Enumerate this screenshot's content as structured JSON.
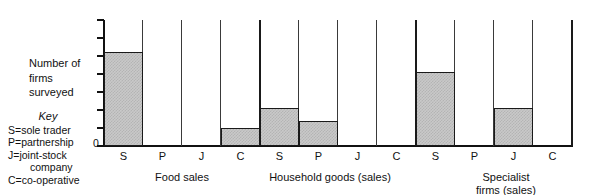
{
  "axis_title": "Number of\nfirms\nsurveyed",
  "key": {
    "title": "Key",
    "entries": [
      "S=sole trader",
      "P=partnership",
      "J=joint-stock",
      "company",
      "C=co-operative"
    ]
  },
  "zero_label": "0",
  "colors": {
    "bar_fill": "#c9c9c9",
    "bar_pattern": "#b4b4b4",
    "line": "#1a1a1a",
    "text": "#111111",
    "background": "#ffffff"
  },
  "chart_data": {
    "type": "bar",
    "title": "",
    "subtitle": "",
    "xlabel": "",
    "ylabel": "Number of firms surveyed",
    "ylim": [
      0,
      7
    ],
    "yticks": [
      0,
      1,
      2,
      3,
      4,
      5,
      6,
      7
    ],
    "ytick_labels": [
      "0",
      "",
      "",
      "",
      "",
      "",
      "",
      ""
    ],
    "grid": false,
    "legend_position": "left",
    "legend_entries": [
      "S=sole trader",
      "P=partnership",
      "J=joint-stock company",
      "C=co-operative"
    ],
    "groups": [
      "Food sales",
      "Household goods (sales)",
      "Specialist firms (sales)"
    ],
    "categories": [
      "S",
      "P",
      "J",
      "C",
      "S",
      "P",
      "J",
      "C",
      "S",
      "P",
      "J",
      "C"
    ],
    "values": [
      5.2,
      0,
      0,
      1,
      2.1,
      1.4,
      0,
      0,
      4.1,
      0,
      2.1,
      0
    ],
    "bars": [
      {
        "group": "Food sales",
        "category": "S",
        "value": 5.2
      },
      {
        "group": "Food sales",
        "category": "P",
        "value": 0
      },
      {
        "group": "Food sales",
        "category": "J",
        "value": 0
      },
      {
        "group": "Food sales",
        "category": "C",
        "value": 1.0
      },
      {
        "group": "Household goods (sales)",
        "category": "S",
        "value": 2.1
      },
      {
        "group": "Household goods (sales)",
        "category": "P",
        "value": 1.4
      },
      {
        "group": "Household goods (sales)",
        "category": "J",
        "value": 0
      },
      {
        "group": "Household goods (sales)",
        "category": "C",
        "value": 0
      },
      {
        "group": "Specialist firms (sales)",
        "category": "S",
        "value": 4.1
      },
      {
        "group": "Specialist firms (sales)",
        "category": "P",
        "value": 0
      },
      {
        "group": "Specialist firms (sales)",
        "category": "J",
        "value": 2.1
      },
      {
        "group": "Specialist firms (sales)",
        "category": "C",
        "value": 0
      }
    ]
  },
  "group_labels": [
    {
      "text": "Food sales",
      "left": 122,
      "width": 120
    },
    {
      "text": "Household goods (sales)",
      "left": 240,
      "width": 180
    },
    {
      "text": "Specialist\nfirms (sales)",
      "left": 458,
      "width": 96
    }
  ]
}
